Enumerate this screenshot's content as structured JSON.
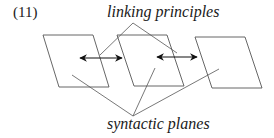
{
  "example_number": "(11)",
  "labels": {
    "top": "linking principles",
    "bottom": "syntactic planes"
  },
  "colors": {
    "stroke": "#555555",
    "arrow": "#111111",
    "text": "#1a1a1a"
  },
  "diagram": {
    "planes": [
      {
        "name": "plane-1",
        "points": "43,35 93,35 109,87 59,87"
      },
      {
        "name": "plane-2",
        "points": "117,35 167,35 184,86 134,86"
      },
      {
        "name": "plane-3",
        "points": "195,37 245,37 262,88 212,88"
      }
    ],
    "arrows": [
      {
        "name": "link-arrow-1-2",
        "x1": 80,
        "y1": 58,
        "x2": 122,
        "y2": 58
      },
      {
        "name": "link-arrow-2-3",
        "x1": 157,
        "y1": 57,
        "x2": 197,
        "y2": 57
      }
    ],
    "top_pointers": [
      {
        "x1": 133,
        "y1": 23,
        "x2": 100,
        "y2": 55
      },
      {
        "x1": 133,
        "y1": 23,
        "x2": 177,
        "y2": 53
      }
    ],
    "bottom_pointers": [
      {
        "x1": 133,
        "y1": 116,
        "x2": 72,
        "y2": 75
      },
      {
        "x1": 133,
        "y1": 116,
        "x2": 155,
        "y2": 68
      },
      {
        "x1": 133,
        "y1": 116,
        "x2": 219,
        "y2": 69
      }
    ]
  }
}
